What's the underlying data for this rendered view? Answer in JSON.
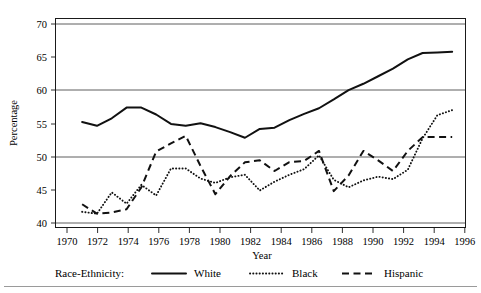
{
  "chart_data": {
    "type": "line",
    "title": "",
    "xlabel": "Year",
    "ylabel": "Percentage",
    "xlim": [
      1969.2,
      1996.9
    ],
    "ylim": [
      38.2,
      71.5
    ],
    "xticks": [
      1970,
      1972,
      1974,
      1976,
      1978,
      1980,
      1982,
      1984,
      1986,
      1988,
      1990,
      1992,
      1994,
      1996
    ],
    "yticks": [
      40,
      45,
      50,
      55,
      60,
      65,
      70
    ],
    "gridlines_y": [
      40,
      50,
      60,
      70
    ],
    "grid": true,
    "legend_position": "below-axis",
    "legend_title": "Race-Ethnicity:",
    "x": [
      1971,
      1972,
      1973,
      1974,
      1975,
      1976,
      1977,
      1978,
      1979,
      1980,
      1981,
      1982,
      1983,
      1984,
      1985,
      1986,
      1987,
      1988,
      1989,
      1990,
      1991,
      1992,
      1993,
      1994,
      1995,
      1996
    ],
    "series": [
      {
        "name": "White",
        "style": "solid",
        "values": [
          55.0,
          54.4,
          55.6,
          57.3,
          57.3,
          56.2,
          54.7,
          54.4,
          54.8,
          54.2,
          53.4,
          52.5,
          53.9,
          54.1,
          55.3,
          56.3,
          57.2,
          58.6,
          60.1,
          61.1,
          62.3,
          63.5,
          65.0,
          66.0,
          66.1,
          66.2
        ]
      },
      {
        "name": "Black",
        "style": "dotted",
        "values": [
          40.7,
          40.4,
          43.8,
          42.0,
          45.0,
          43.3,
          47.6,
          47.6,
          46.0,
          45.3,
          46.2,
          46.6,
          44.1,
          45.5,
          46.6,
          47.5,
          49.7,
          45.8,
          44.6,
          45.7,
          46.3,
          45.9,
          47.4,
          52.4,
          56.1,
          56.9
        ]
      },
      {
        "name": "Hispanic",
        "style": "dashed",
        "values": [
          41.9,
          40.4,
          40.6,
          41.1,
          44.6,
          50.3,
          51.6,
          52.8,
          48.0,
          43.5,
          46.4,
          48.6,
          48.9,
          47.2,
          48.6,
          48.8,
          50.4,
          44.0,
          46.5,
          50.4,
          48.9,
          47.2,
          50.4,
          52.6,
          52.6,
          52.6
        ]
      }
    ]
  },
  "axes": {
    "x_title": "Year",
    "y_title": "Percentage",
    "x_tick_labels": [
      "1970",
      "1972",
      "1974",
      "1976",
      "1978",
      "1980",
      "1982",
      "1984",
      "1986",
      "1988",
      "1990",
      "1992",
      "1994",
      "1996"
    ],
    "y_tick_labels": [
      "40",
      "45",
      "50",
      "55",
      "60",
      "65",
      "70"
    ]
  },
  "legend": {
    "title": "Race-Ethnicity:",
    "entries": [
      {
        "label": "White",
        "style": "solid"
      },
      {
        "label": "Black",
        "style": "dotted"
      },
      {
        "label": "Hispanic",
        "style": "dashed"
      }
    ]
  }
}
